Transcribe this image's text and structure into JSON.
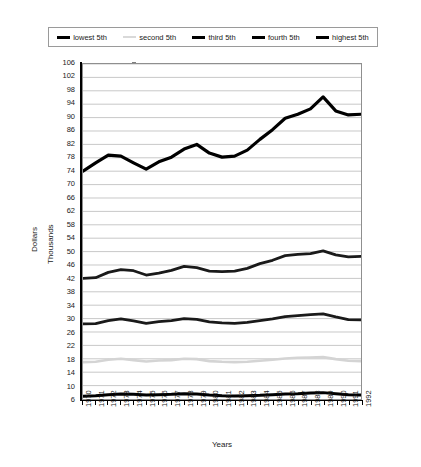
{
  "chart": {
    "y_axis_title_line1": "Dollars",
    "y_axis_title_line2": "Thousands",
    "x_axis_title": "Years"
  },
  "legend": {
    "items": [
      {
        "label": "lowest 5th",
        "color": "#000000",
        "weight": "thick"
      },
      {
        "label": "second 5th",
        "color": "#d9d9d9",
        "weight": "thin"
      },
      {
        "label": "third 5th",
        "color": "#000000",
        "weight": "thick"
      },
      {
        "label": "fourth 5th",
        "color": "#000000",
        "weight": "thick"
      },
      {
        "label": "highest 5th",
        "color": "#000000",
        "weight": "thick"
      }
    ]
  },
  "chart_data": {
    "type": "line",
    "title": "",
    "xlabel": "Years",
    "ylabel": "Dollars Thousands",
    "grid": true,
    "legend_position": "top",
    "xlim": [
      1970,
      1992
    ],
    "ylim": [
      6,
      106
    ],
    "ytick_step": 4,
    "yticks": [
      6,
      10,
      14,
      18,
      22,
      26,
      30,
      34,
      38,
      42,
      46,
      50,
      54,
      58,
      62,
      66,
      70,
      74,
      78,
      82,
      86,
      90,
      94,
      98,
      102,
      106
    ],
    "categories": [
      1970,
      1971,
      1972,
      1973,
      1974,
      1975,
      1976,
      1977,
      1978,
      1979,
      1980,
      1981,
      1982,
      1983,
      1984,
      1985,
      1986,
      1987,
      1988,
      1989,
      1990,
      1991,
      1992
    ],
    "series": [
      {
        "name": "highest 5th",
        "color": "#000000",
        "width": 3.2,
        "values": [
          74.0,
          76.5,
          78.8,
          78.5,
          76.5,
          74.6,
          76.8,
          78.2,
          80.6,
          82.0,
          79.4,
          78.2,
          78.5,
          80.3,
          83.5,
          86.4,
          89.8,
          91.0,
          92.6,
          96.2,
          92.0,
          90.8,
          91.0
        ]
      },
      {
        "name": "fourth 5th",
        "color": "#1a1a1a",
        "width": 2.8,
        "values": [
          42.0,
          42.2,
          43.8,
          44.6,
          44.3,
          43.0,
          43.6,
          44.4,
          45.6,
          45.2,
          44.2,
          44.0,
          44.2,
          45.0,
          46.4,
          47.4,
          48.8,
          49.2,
          49.4,
          50.2,
          49.0,
          48.4,
          48.6
        ]
      },
      {
        "name": "third 5th",
        "color": "#1a1a1a",
        "width": 2.8,
        "values": [
          28.4,
          28.5,
          29.4,
          29.9,
          29.3,
          28.6,
          29.1,
          29.4,
          30.0,
          29.8,
          29.0,
          28.7,
          28.6,
          28.9,
          29.4,
          29.9,
          30.6,
          30.9,
          31.2,
          31.4,
          30.5,
          29.7,
          29.6
        ]
      },
      {
        "name": "second 5th",
        "color": "#d4d4d4",
        "width": 2.6,
        "values": [
          17.0,
          17.1,
          17.7,
          18.0,
          17.6,
          17.2,
          17.5,
          17.6,
          18.0,
          17.9,
          17.3,
          17.1,
          17.0,
          17.1,
          17.4,
          17.7,
          18.1,
          18.3,
          18.4,
          18.5,
          17.9,
          17.4,
          17.3
        ]
      },
      {
        "name": "lowest 5th",
        "color": "#000000",
        "width": 3.0,
        "values": [
          6.8,
          7.0,
          7.3,
          7.5,
          7.4,
          7.2,
          7.3,
          7.4,
          7.6,
          7.5,
          7.2,
          7.0,
          6.9,
          7.0,
          7.1,
          7.3,
          7.5,
          7.6,
          7.8,
          7.9,
          7.6,
          7.3,
          7.2
        ]
      }
    ]
  }
}
